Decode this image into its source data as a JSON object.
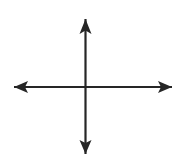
{
  "canvas": {
    "width": 182,
    "height": 163,
    "background_color": "#ffffff",
    "title": "Crossed double-headed arrows (coordinate axes)"
  },
  "diagram": {
    "type": "axes-cross",
    "stroke_color": "#262626",
    "stroke_width": 2.2,
    "origin": {
      "x": 85.5,
      "y": 87
    },
    "axes": [
      {
        "name": "horizontal-axis",
        "orientation": "horizontal",
        "x1": 14,
        "y1": 87,
        "x2": 172,
        "y2": 87,
        "double_headed": true
      },
      {
        "name": "vertical-axis",
        "orientation": "vertical",
        "x1": 85.5,
        "y1": 19,
        "x2": 85.5,
        "y2": 154,
        "double_headed": true
      }
    ],
    "arrow_heads": [
      {
        "name": "arrow-head-up",
        "direction": "up",
        "tip_x": 85.5,
        "tip_y": 19,
        "length": 15,
        "width": 12,
        "points": "85.5,19 79.5,34 85.5,30.5 91.5,34"
      },
      {
        "name": "arrow-head-down",
        "direction": "down",
        "tip_x": 85.5,
        "tip_y": 154,
        "length": 14,
        "width": 12,
        "points": "85.5,154 79.5,140 85.5,143 91.5,140"
      },
      {
        "name": "arrow-head-left",
        "direction": "left",
        "tip_x": 14,
        "tip_y": 87,
        "length": 14,
        "width": 12,
        "points": "14,87 28,81 25,87 28,93"
      },
      {
        "name": "arrow-head-right",
        "direction": "right",
        "tip_x": 172,
        "tip_y": 87,
        "length": 14,
        "width": 12,
        "points": "172,87 158,81 161,87 158,93"
      }
    ]
  }
}
